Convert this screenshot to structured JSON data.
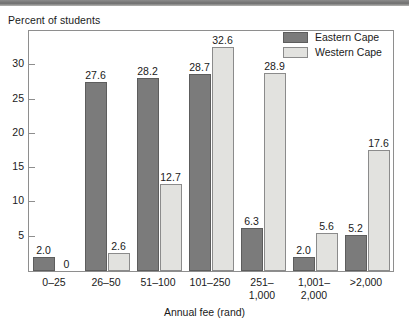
{
  "scan_band": {
    "name": "page-edge-band"
  },
  "chart_data": {
    "type": "bar",
    "title": "",
    "ylabel": "Percent of students",
    "xlabel": "Annual fee (rand)",
    "categories": [
      "0–25",
      "26–50",
      "51–100",
      "101–250",
      "251–\n1,000",
      "1,001–\n2,000",
      ">2,000"
    ],
    "series": [
      {
        "name": "Eastern Cape",
        "color": "#7b7b7b",
        "values": [
          2.0,
          27.6,
          28.2,
          28.7,
          6.3,
          2.0,
          5.2
        ],
        "labels": [
          "2.0",
          "27.6",
          "28.2",
          "28.7",
          "6.3",
          "2.0",
          "5.2"
        ]
      },
      {
        "name": "Western Cape",
        "color": "#e2e2df",
        "values": [
          0,
          2.6,
          12.7,
          32.6,
          28.9,
          5.6,
          17.6
        ],
        "labels": [
          "0",
          "2.6",
          "12.7",
          "32.6",
          "28.9",
          "5.6",
          "17.6"
        ]
      }
    ],
    "ylim": [
      0,
      35
    ],
    "yticks": [
      5,
      10,
      15,
      20,
      25,
      30
    ],
    "ytick_labels": [
      "5",
      "10",
      "15",
      "20",
      "25",
      "30"
    ],
    "grid": false,
    "legend_position": "top-right"
  },
  "legend": {
    "entries": [
      {
        "label": "Eastern Cape",
        "swatch": "eastern"
      },
      {
        "label": "Western Cape",
        "swatch": "western"
      }
    ]
  }
}
